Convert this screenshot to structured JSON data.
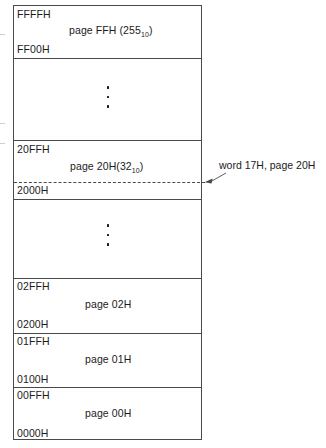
{
  "diagram": {
    "background_color": "#ffffff",
    "line_color": "#4a4a4a",
    "text_color": "#1b1b1b"
  },
  "blocks": [
    {
      "id": "page-ff",
      "top_address": "FFFFH",
      "bottom_address": "FF00H",
      "page_label": "page FFH (255",
      "page_subscript": "10",
      "page_label_suffix": ")"
    },
    {
      "id": "gap-upper",
      "top_address": "",
      "bottom_address": "",
      "page_label": "",
      "page_subscript": "",
      "page_label_suffix": ""
    },
    {
      "id": "page-20",
      "top_address": "20FFH",
      "bottom_address": "2000H",
      "page_label": "page 20H(32",
      "page_subscript": "10",
      "page_label_suffix": ")"
    },
    {
      "id": "gap-lower",
      "top_address": "",
      "bottom_address": "",
      "page_label": "",
      "page_subscript": "",
      "page_label_suffix": ""
    },
    {
      "id": "page-02",
      "top_address": "02FFH",
      "bottom_address": "0200H",
      "page_label": "page 02H",
      "page_subscript": "",
      "page_label_suffix": ""
    },
    {
      "id": "page-01",
      "top_address": "01FFH",
      "bottom_address": "0100H",
      "page_label": "page 01H",
      "page_subscript": "",
      "page_label_suffix": ""
    },
    {
      "id": "page-00",
      "top_address": "00FFH",
      "bottom_address": "0000H",
      "page_label": "page 00H",
      "page_subscript": "",
      "page_label_suffix": ""
    }
  ],
  "annotation": {
    "text": "word 17H, page 20H",
    "points_to": "dashed line at 2000H + 17H inside page 20H"
  },
  "ellipsis": {
    "glyph_count": 3,
    "meaning": "continuation of omitted pages"
  }
}
